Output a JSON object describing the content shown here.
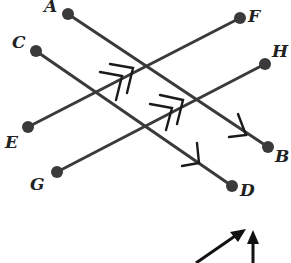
{
  "diagram": {
    "points": {
      "A": {
        "label": "A",
        "x": 68,
        "y": 14
      },
      "B": {
        "label": "B",
        "x": 268,
        "y": 147
      },
      "C": {
        "label": "C",
        "x": 36,
        "y": 51
      },
      "D": {
        "label": "D",
        "x": 232,
        "y": 186
      },
      "E": {
        "label": "E",
        "x": 28,
        "y": 127
      },
      "F": {
        "label": "F",
        "x": 240,
        "y": 18
      },
      "G": {
        "label": "G",
        "x": 57,
        "y": 172
      },
      "H": {
        "label": "H",
        "x": 265,
        "y": 64
      }
    },
    "segments": [
      {
        "name": "AB",
        "from": "A",
        "to": "B",
        "marks": "single-arrow"
      },
      {
        "name": "CD",
        "from": "C",
        "to": "D",
        "marks": "single-arrow"
      },
      {
        "name": "EF",
        "from": "E",
        "to": "F",
        "marks": "double-arrow"
      },
      {
        "name": "GH",
        "from": "G",
        "to": "H",
        "marks": "double-arrow"
      }
    ],
    "labels": {
      "A": "A",
      "B": "B",
      "C": "C",
      "D": "D",
      "E": "E",
      "F": "F",
      "G": "G",
      "H": "H"
    },
    "bottom_arrows": [
      "diagonal-arrow",
      "vertical-arrow"
    ]
  }
}
